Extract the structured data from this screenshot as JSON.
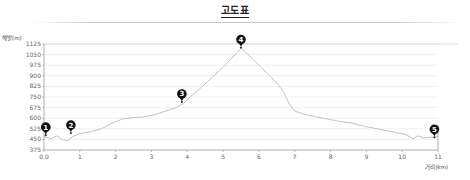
{
  "title": "고도표",
  "chart_data": {
    "type": "line",
    "title": "고도표",
    "xlabel": "거리(km)",
    "ylabel": "해발(m)",
    "xlim": [
      0,
      11
    ],
    "ylim": [
      375,
      1125
    ],
    "x_ticks": [
      "0.0",
      "1",
      "2",
      "3",
      "4",
      "5",
      "6",
      "7",
      "8",
      "9",
      "10",
      "11"
    ],
    "y_ticks": [
      "1125",
      "1050",
      "975",
      "900",
      "825",
      "750",
      "675",
      "600",
      "525",
      "450",
      "375"
    ],
    "grid": "horizontal",
    "series": [
      {
        "name": "elevation",
        "x": [
          0,
          0.2,
          0.35,
          0.5,
          0.65,
          0.8,
          1.0,
          1.3,
          1.6,
          1.9,
          2.2,
          2.5,
          2.8,
          3.1,
          3.4,
          3.7,
          3.9,
          4.1,
          4.4,
          4.7,
          5.0,
          5.3,
          5.5,
          5.7,
          5.9,
          6.1,
          6.3,
          6.5,
          6.7,
          6.85,
          7.0,
          7.3,
          7.6,
          8.0,
          8.3,
          8.6,
          8.9,
          9.2,
          9.5,
          9.8,
          10.1,
          10.3,
          10.45,
          10.6,
          10.75,
          10.9,
          11.0
        ],
        "y": [
          470,
          455,
          475,
          450,
          440,
          470,
          490,
          505,
          525,
          565,
          595,
          605,
          610,
          625,
          650,
          675,
          705,
          755,
          820,
          890,
          960,
          1040,
          1095,
          1050,
          1000,
          950,
          900,
          850,
          780,
          700,
          650,
          625,
          610,
          590,
          575,
          565,
          545,
          530,
          515,
          500,
          485,
          455,
          475,
          460,
          465,
          465,
          470
        ]
      }
    ],
    "annotations": [
      {
        "label": "1",
        "x": 0.05,
        "y": 480
      },
      {
        "label": "2",
        "x": 0.75,
        "y": 495
      },
      {
        "label": "3",
        "x": 3.85,
        "y": 715
      },
      {
        "label": "4",
        "x": 5.5,
        "y": 1100
      },
      {
        "label": "5",
        "x": 10.9,
        "y": 465
      }
    ],
    "colors": {
      "line": "#bbbbbb",
      "marker": "#111111",
      "grid": "#f0f0f0",
      "axis": "#999999"
    }
  }
}
